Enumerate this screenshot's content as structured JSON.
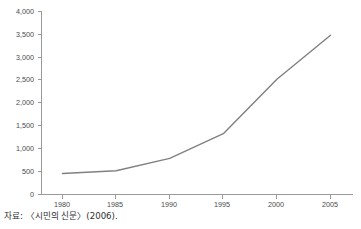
{
  "chart_data": {
    "type": "line",
    "title": "",
    "subtitle": "",
    "xlabel": "",
    "ylabel": "",
    "x": [
      1980,
      1985,
      1990,
      1995,
      2000,
      2005
    ],
    "categories": [
      "1980",
      "1985",
      "1990",
      "1995",
      "2000",
      "2005"
    ],
    "values": [
      460,
      520,
      790,
      1330,
      2520,
      3480
    ],
    "series": [
      {
        "name": "",
        "values": [
          460,
          520,
          790,
          1330,
          2520,
          3480
        ]
      }
    ],
    "xlim": [
      1977,
      1982
    ],
    "ylim": [
      0,
      4000
    ],
    "y_tick_values": [
      0,
      500,
      1000,
      1500,
      2000,
      2500,
      3000,
      3500,
      4000
    ],
    "y_tick_labels": [
      "0",
      "500",
      "1,000",
      "1,500",
      "2,000",
      "2,500",
      "3,000",
      "3,500",
      "4,000"
    ],
    "x_tick_labels": [
      "1980",
      "1985",
      "1990",
      "1995",
      "2000",
      "2005"
    ],
    "grid": false,
    "legend": "none",
    "line_color": "#808080",
    "axis_color": "#9a9a9a"
  },
  "source_note": "자료: 〈시민의 신문〉(2006)."
}
